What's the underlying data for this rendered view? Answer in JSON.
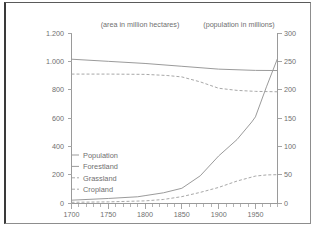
{
  "chart_data": {
    "type": "line",
    "title": "",
    "subtitle": "",
    "left_axis_caption": "(area in million hectares)",
    "right_axis_caption": "(population in millions)",
    "xlabel": "",
    "ylabel": "",
    "xlim": [
      1700,
      1980
    ],
    "x_ticks": [
      1700,
      1750,
      1800,
      1850,
      1900,
      1950
    ],
    "x_tick_labels": [
      "1700",
      "1750",
      "1800",
      "1850",
      "1900",
      "1950"
    ],
    "x_minor_tick_step": 10,
    "left_ylim": [
      0,
      1200
    ],
    "left_y_ticks": [
      0,
      200,
      400,
      600,
      800,
      1000,
      1200
    ],
    "left_y_tick_labels": [
      "0",
      "200",
      "400",
      "600",
      "800",
      "1.000",
      "1.200"
    ],
    "right_ylim": [
      0,
      300
    ],
    "right_y_ticks": [
      0,
      50,
      100,
      150,
      200,
      250,
      300
    ],
    "right_y_tick_labels": [
      "0",
      "50",
      "100",
      "150",
      "200",
      "250",
      "300"
    ],
    "grid": false,
    "legend_position": "center-left",
    "x": [
      1700,
      1750,
      1800,
      1850,
      1900,
      1950,
      1980
    ],
    "series": [
      {
        "name": "Population",
        "axis": "right",
        "style": "solid",
        "unit": "millions",
        "values": [
          5,
          8,
          13,
          26,
          83,
          145,
          255
        ],
        "points": [
          [
            1700,
            5
          ],
          [
            1750,
            8
          ],
          [
            1790,
            11
          ],
          [
            1800,
            13
          ],
          [
            1825,
            18
          ],
          [
            1850,
            26
          ],
          [
            1875,
            48
          ],
          [
            1900,
            83
          ],
          [
            1925,
            112
          ],
          [
            1945,
            143
          ],
          [
            1950,
            152
          ],
          [
            1965,
            205
          ],
          [
            1980,
            255
          ]
        ]
      },
      {
        "name": "Forestland",
        "axis": "left",
        "style": "solid",
        "unit": "million hectares",
        "values": [
          1015,
          1000,
          985,
          965,
          945,
          935,
          935
        ],
        "points": [
          [
            1700,
            1015
          ],
          [
            1750,
            1000
          ],
          [
            1800,
            985
          ],
          [
            1850,
            965
          ],
          [
            1900,
            945
          ],
          [
            1950,
            936
          ],
          [
            1980,
            935
          ]
        ]
      },
      {
        "name": "Grassland",
        "axis": "left",
        "style": "dashed",
        "unit": "million hectares",
        "values": [
          910,
          910,
          908,
          890,
          810,
          787,
          785
        ],
        "points": [
          [
            1700,
            910
          ],
          [
            1750,
            910
          ],
          [
            1800,
            908
          ],
          [
            1830,
            900
          ],
          [
            1850,
            890
          ],
          [
            1875,
            855
          ],
          [
            1900,
            810
          ],
          [
            1925,
            795
          ],
          [
            1950,
            788
          ],
          [
            1980,
            785
          ]
        ]
      },
      {
        "name": "Cropland",
        "axis": "left",
        "style": "dashed",
        "unit": "million hectares",
        "values": [
          5,
          8,
          15,
          45,
          110,
          190,
          200
        ],
        "points": [
          [
            1700,
            5
          ],
          [
            1750,
            8
          ],
          [
            1800,
            15
          ],
          [
            1825,
            25
          ],
          [
            1850,
            45
          ],
          [
            1875,
            75
          ],
          [
            1900,
            110
          ],
          [
            1925,
            155
          ],
          [
            1950,
            190
          ],
          [
            1965,
            198
          ],
          [
            1980,
            200
          ]
        ]
      }
    ],
    "legend_entries": [
      {
        "label": "Population",
        "style": "solid"
      },
      {
        "label": "Forestland",
        "style": "solid"
      },
      {
        "label": "Grassland",
        "style": "dashed"
      },
      {
        "label": "Cropland",
        "style": "dashed"
      }
    ],
    "colors": {
      "line": "#9b9b9b",
      "dashed_line": "#a8a8a8",
      "axis": "#9a9a9a",
      "text": "#6f6f6f",
      "background": "#ffffff",
      "frame": "#8d8d8d"
    }
  }
}
